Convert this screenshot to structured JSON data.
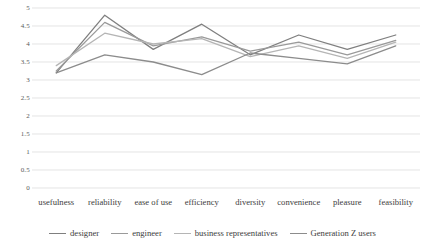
{
  "chart_data": {
    "type": "line",
    "title": "",
    "xlabel": "",
    "ylabel": "",
    "ylim": [
      0,
      5
    ],
    "ytick_step": 0.5,
    "grid": true,
    "legend_position": "bottom",
    "categories": [
      "usefulness",
      "reliability",
      "ease of use",
      "efficiency",
      "diversity",
      "convenience",
      "pleasure",
      "feasibility"
    ],
    "ytick_labels": [
      "5",
      "4.5",
      "4",
      "3.5",
      "3",
      "2.5",
      "2",
      "1.5",
      "1",
      "0.5",
      "0"
    ],
    "series": [
      {
        "name": "designer",
        "color": "#7f7f7f",
        "values": [
          3.2,
          4.8,
          3.85,
          4.55,
          3.7,
          4.25,
          3.85,
          4.25
        ]
      },
      {
        "name": "engineer",
        "color": "#9a9a9a",
        "values": [
          3.25,
          4.6,
          3.95,
          4.2,
          3.8,
          4.05,
          3.7,
          4.1
        ]
      },
      {
        "name": "business representatives",
        "color": "#b5b5b5",
        "values": [
          3.4,
          4.3,
          4.0,
          4.15,
          3.65,
          3.95,
          3.6,
          4.05
        ]
      },
      {
        "name": "Generation Z users",
        "color": "#8c8c8c",
        "values": [
          3.2,
          3.7,
          3.5,
          3.15,
          3.75,
          3.6,
          3.45,
          3.95
        ]
      }
    ]
  },
  "legend": {
    "items": [
      {
        "label": "designer"
      },
      {
        "label": "engineer"
      },
      {
        "label": "business representatives"
      },
      {
        "label": "Generation Z users"
      }
    ]
  },
  "axes": {
    "y_axis_name": "rating-scale",
    "x_axis_name": "evaluation-criteria"
  }
}
